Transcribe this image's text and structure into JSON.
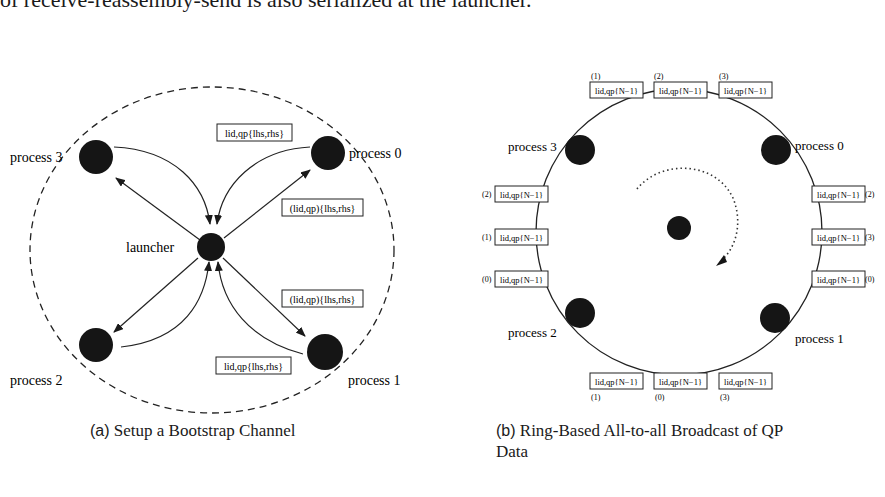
{
  "body_text": "of receive-reassembly-send is also serialized at the launcher.",
  "figure_a": {
    "caption_label": "(a)",
    "caption_text": "Setup a Bootstrap Channel",
    "center_node": "launcher",
    "processes": [
      "process 0",
      "process 1",
      "process 2",
      "process 3"
    ],
    "messages": {
      "p0_to_launcher": "lid,qp{lhs,rhs}",
      "launcher_to_p0": "(lid,qp){lhs,rhs}",
      "launcher_to_p1": "(lid,qp){lhs,rhs}",
      "p1_to_launcher": "lid,qp{lhs,rhs}"
    }
  },
  "figure_b": {
    "caption_label": "(b)",
    "caption_line1": "Ring-Based All-to-all Broadcast of QP",
    "caption_line2": "Data",
    "processes": [
      "process 0",
      "process 1",
      "process 2",
      "process 3"
    ],
    "box_text": "lid,qp{N−1}",
    "top_boxes": [
      "(1)",
      "(2)",
      "(3)"
    ],
    "left_boxes": [
      "(2)",
      "(1)",
      "(0)"
    ],
    "right_boxes": [
      "(2)",
      "(3)",
      "(0)"
    ],
    "bottom_boxes": [
      "(1)",
      "(0)",
      "(3)"
    ]
  }
}
